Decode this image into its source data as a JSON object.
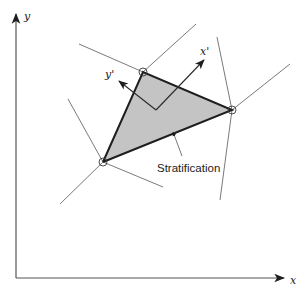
{
  "diagram": {
    "axes": {
      "x_label": "x",
      "y_label": "y"
    },
    "local_frame": {
      "x_label": "x'",
      "y_label": "y'"
    },
    "triangle": {
      "vertices": {
        "top": [
          143,
          72
        ],
        "right": [
          232,
          110
        ],
        "bottom_left": [
          103,
          162
        ]
      },
      "fill_color": "#c4c4c4",
      "edge_color": "#1e1e1e"
    },
    "annotation": {
      "text": "Stratification"
    }
  }
}
